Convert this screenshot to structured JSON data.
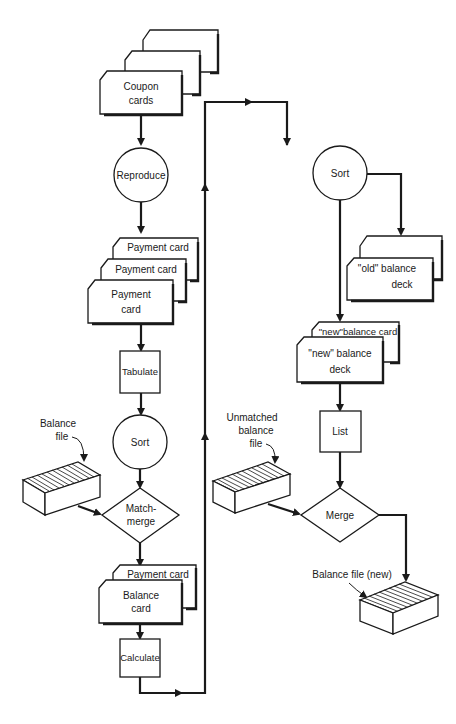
{
  "diagram": {
    "type": "flowchart",
    "left_column": {
      "coupon_cards": {
        "line1": "Coupon",
        "line2": "cards"
      },
      "reproduce": "Reproduce",
      "payment_card_back1": "Payment card",
      "payment_card_back2": "Payment card",
      "payment_card_front": {
        "line1": "Payment",
        "line2": "card"
      },
      "tabulate": "Tabulate",
      "sort": "Sort",
      "balance_file_label": {
        "line1": "Balance",
        "line2": "file"
      },
      "match_merge": {
        "line1": "Match-",
        "line2": "merge"
      },
      "payment_card_back3": "Payment card",
      "balance_card": {
        "line1": "Balance",
        "line2": "card"
      },
      "calculate": "Calculate"
    },
    "right_column": {
      "sort": "Sort",
      "old_balance_deck": {
        "line1": "\"old\" balance",
        "line2": "deck"
      },
      "new_balance_card": "\"new\"balance card",
      "new_balance_deck": {
        "line1": "\"new\" balance",
        "line2": "deck"
      },
      "list": "List",
      "unmatched_label": {
        "line1": "Unmatched",
        "line2": "balance",
        "line3": "file"
      },
      "merge": "Merge",
      "balance_file_new_label": "Balance file (new)"
    }
  }
}
